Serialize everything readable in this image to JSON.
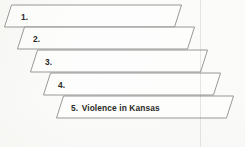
{
  "diagram": {
    "type": "staircase-parallelograms",
    "orientation": "descending-right",
    "background_color": "#fbfbfa",
    "stroke_color": "#8d8d8a",
    "text_color": "#2a2a28",
    "steps": [
      {
        "number": "1.",
        "text": "",
        "label_x": 21,
        "label_y": 13,
        "points": "11.5,5 181.5,5 174.5,27 4.5,27"
      },
      {
        "number": "2.",
        "text": "",
        "label_x": 33,
        "label_y": 35,
        "points": "24.5,27 194.5,27 187.5,49 17.5,49"
      },
      {
        "number": "3.",
        "text": "",
        "label_x": 45,
        "label_y": 58,
        "points": "37.5,50 207.5,50 200.5,72 30.5,72"
      },
      {
        "number": "4.",
        "text": "",
        "label_x": 58,
        "label_y": 81,
        "points": "50.5,73 220.5,73 213.5,95 43.5,95"
      },
      {
        "number": "5.",
        "text": "Violence in Kansas",
        "label_x": 71,
        "label_y": 104,
        "points": "63.5,96 233.5,96 226.5,118 56.5,118"
      }
    ]
  }
}
